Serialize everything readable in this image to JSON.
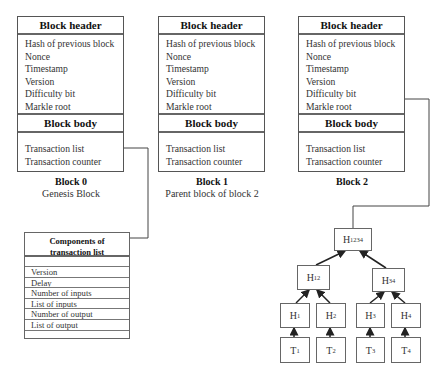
{
  "blocks": [
    {
      "header_title": "Block header",
      "header_fields": [
        "Hash of previous block",
        "Nonce",
        "Timestamp",
        "Version",
        "Difficulty bit",
        "Markle root"
      ],
      "body_title": "Block body",
      "body_fields": [
        "Transaction list",
        "Transaction counter"
      ],
      "caption_title": "Block 0",
      "caption_subtitle": "Genesis Block"
    },
    {
      "header_title": "Block header",
      "header_fields": [
        "Hash of previous block",
        "Nonce",
        "Timestamp",
        "Version",
        "Difficulty bit",
        "Markle root"
      ],
      "body_title": "Block body",
      "body_fields": [
        "Transaction list",
        "Transaction counter"
      ],
      "caption_title": "Block 1",
      "caption_subtitle": "Parent block of block 2"
    },
    {
      "header_title": "Block header",
      "header_fields": [
        "Hash of previous block",
        "Nonce",
        "Timestamp",
        "Version",
        "Difficulty bit",
        "Markle root"
      ],
      "body_title": "Block body",
      "body_fields": [
        "Transaction list",
        "Transaction counter"
      ],
      "caption_title": "Block 2",
      "caption_subtitle": ""
    }
  ],
  "components": {
    "title_line1": "Components of",
    "title_line2": "transaction list",
    "rows": [
      "",
      "Version",
      "Delay",
      "Number of inputs",
      "List of inputs",
      "Number of output",
      "List of output",
      ""
    ]
  },
  "merkle_tree": {
    "root": {
      "base": "H",
      "sub": "1234"
    },
    "level1": [
      {
        "base": "H",
        "sub": "12"
      },
      {
        "base": "H",
        "sub": "34"
      }
    ],
    "level2": [
      {
        "base": "H",
        "sub": "1"
      },
      {
        "base": "H",
        "sub": "2"
      },
      {
        "base": "H",
        "sub": "3"
      },
      {
        "base": "H",
        "sub": "4"
      }
    ],
    "leaves": [
      {
        "base": "T",
        "sub": "1"
      },
      {
        "base": "T",
        "sub": "2"
      },
      {
        "base": "T",
        "sub": "3"
      },
      {
        "base": "T",
        "sub": "4"
      }
    ]
  }
}
